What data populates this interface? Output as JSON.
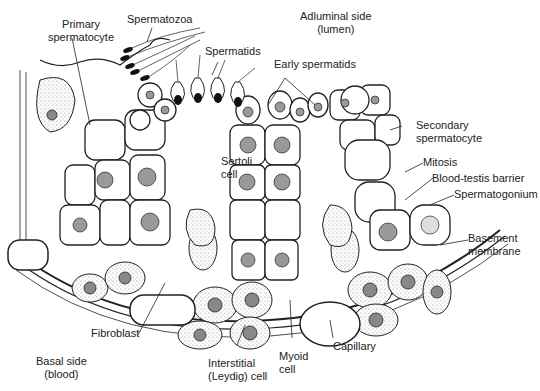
{
  "diagram": {
    "labels": {
      "primary_spermatocyte": [
        "Primary",
        "spermatocyte"
      ],
      "spermatozoa": "Spermatozoa",
      "adluminal": [
        "Adluminal side",
        "(lumen)"
      ],
      "spermatids": "Spermatids",
      "early_spermatids": "Early spermatids",
      "sertoli": [
        "Sertoli",
        "cell"
      ],
      "secondary_spermatocyte": [
        "Secondary",
        "spermatocyte"
      ],
      "mitosis": "Mitosis",
      "blood_testis_barrier": "Blood-testis barrier",
      "spermatogonium": "Spermatogonium",
      "basement_membrane": [
        "Basement",
        "membrane"
      ],
      "fibroblast": "Fibroblast",
      "basal_side": [
        "Basal side",
        "(blood)"
      ],
      "interstitial": [
        "Interstitial",
        "(Leydig) cell"
      ],
      "myoid": [
        "Myoid",
        "cell"
      ],
      "capillary": "Capillary"
    },
    "colors": {
      "line": "#222222",
      "stipple": "#d9d9d9",
      "background": "#ffffff"
    }
  }
}
